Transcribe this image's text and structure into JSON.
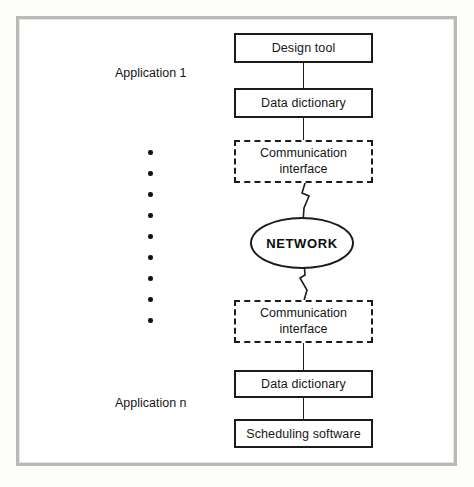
{
  "diagram": {
    "frame": {
      "border_color": "#b9b9b5",
      "background": "#ffffff"
    },
    "labels": {
      "application_top": "Application 1",
      "application_bottom": "Application n"
    },
    "nodes": [
      {
        "id": "design-tool",
        "label": "Design tool",
        "shape": "rect",
        "style": "solid"
      },
      {
        "id": "data-dictionary-top",
        "label": "Data dictionary",
        "shape": "rect",
        "style": "solid"
      },
      {
        "id": "comm-interface-top",
        "label_line1": "Communication",
        "label_line2": "interface",
        "shape": "rect",
        "style": "dashed"
      },
      {
        "id": "network",
        "label": "NETWORK",
        "shape": "ellipse",
        "style": "solid"
      },
      {
        "id": "comm-interface-bottom",
        "label_line1": "Communication",
        "label_line2": "interface",
        "shape": "rect",
        "style": "dashed"
      },
      {
        "id": "data-dictionary-bottom",
        "label": "Data dictionary",
        "shape": "rect",
        "style": "solid"
      },
      {
        "id": "scheduling-software",
        "label": "Scheduling software",
        "shape": "rect",
        "style": "solid"
      }
    ],
    "connectors": [
      {
        "from": "design-tool",
        "to": "data-dictionary-top",
        "style": "line"
      },
      {
        "from": "data-dictionary-top",
        "to": "comm-interface-top",
        "style": "line"
      },
      {
        "from": "comm-interface-top",
        "to": "network",
        "style": "lightning"
      },
      {
        "from": "network",
        "to": "comm-interface-bottom",
        "style": "lightning"
      },
      {
        "from": "comm-interface-bottom",
        "to": "data-dictionary-bottom",
        "style": "line"
      },
      {
        "from": "data-dictionary-bottom",
        "to": "scheduling-software",
        "style": "line"
      }
    ],
    "ellipsis": {
      "symbol": "vertical-dots",
      "count": 9,
      "color": "#111111"
    },
    "colors": {
      "stroke": "#1b1b1b",
      "text": "#161616",
      "frame": "#b9b9b5",
      "canvas": "#ffffff"
    }
  }
}
